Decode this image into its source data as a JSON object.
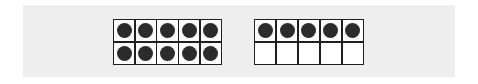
{
  "page": {
    "width": 478,
    "height": 84,
    "background_color": "#ffffff"
  },
  "band": {
    "name": "worksheet-band",
    "background_color": "#eeeeee"
  },
  "style": {
    "counter_color": "#2b2b2b",
    "cell_fill_color": "#ffffff",
    "grid_line_color": "#1f1f1f"
  },
  "chart_data": {
    "type": "table",
    "xlabel": "",
    "ylabel": "",
    "categories": [
      "Ten frame 1",
      "Ten frame 2"
    ],
    "values": [
      10,
      5
    ],
    "legend": [],
    "grid": true
  },
  "frames": [
    {
      "name": "ten-frame-left",
      "filled_count": 10,
      "total_cells": 10,
      "rows": [
        [
          {
            "name": "cell-r1c1",
            "filled": true
          },
          {
            "name": "cell-r1c2",
            "filled": true
          },
          {
            "name": "cell-r1c3",
            "filled": true
          },
          {
            "name": "cell-r1c4",
            "filled": true
          },
          {
            "name": "cell-r1c5",
            "filled": true
          }
        ],
        [
          {
            "name": "cell-r2c1",
            "filled": true
          },
          {
            "name": "cell-r2c2",
            "filled": true
          },
          {
            "name": "cell-r2c3",
            "filled": true
          },
          {
            "name": "cell-r2c4",
            "filled": true
          },
          {
            "name": "cell-r2c5",
            "filled": true
          }
        ]
      ]
    },
    {
      "name": "ten-frame-right",
      "filled_count": 5,
      "total_cells": 10,
      "rows": [
        [
          {
            "name": "cell-r1c1",
            "filled": true
          },
          {
            "name": "cell-r1c2",
            "filled": true
          },
          {
            "name": "cell-r1c3",
            "filled": true
          },
          {
            "name": "cell-r1c4",
            "filled": true
          },
          {
            "name": "cell-r1c5",
            "filled": true
          }
        ],
        [
          {
            "name": "cell-r2c1",
            "filled": false
          },
          {
            "name": "cell-r2c2",
            "filled": false
          },
          {
            "name": "cell-r2c3",
            "filled": false
          },
          {
            "name": "cell-r2c4",
            "filled": false
          },
          {
            "name": "cell-r2c5",
            "filled": false
          }
        ]
      ]
    }
  ]
}
